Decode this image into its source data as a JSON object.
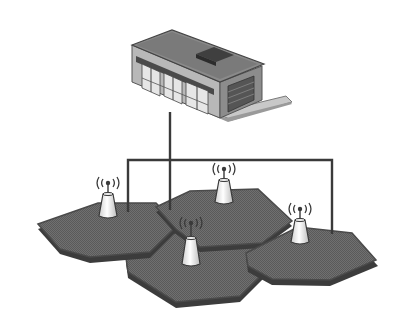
{
  "diagram": {
    "colors": {
      "background": "#ffffff",
      "cell_fill": "#6e6e6e",
      "cell_shadow": "#3c3c3c",
      "cell_edge": "#4a4a4a",
      "wire": "#3a3a3a",
      "antenna_body": "#f2f2f2",
      "antenna_outline": "#3a3a3a",
      "building_roof": "#8a8a8a",
      "building_wall": "#b8b8b8",
      "building_dark": "#4a4a4a",
      "ground_plate": "#c8c8c8"
    },
    "nodes": [
      {
        "id": "office",
        "type": "building",
        "icon": "building-icon"
      },
      {
        "id": "bs-left",
        "type": "base-station",
        "icon": "antenna-icon"
      },
      {
        "id": "bs-top",
        "type": "base-station",
        "icon": "antenna-icon"
      },
      {
        "id": "bs-right",
        "type": "base-station",
        "icon": "antenna-icon"
      },
      {
        "id": "bs-center",
        "type": "base-station",
        "icon": "antenna-icon"
      }
    ],
    "cells": [
      {
        "id": "cell-left"
      },
      {
        "id": "cell-top"
      },
      {
        "id": "cell-right"
      },
      {
        "id": "cell-bottom"
      }
    ]
  }
}
